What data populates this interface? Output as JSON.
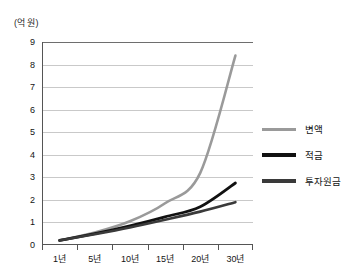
{
  "chart_data": {
    "type": "line",
    "title": "",
    "subtitle": "",
    "xlabel": "",
    "ylabel": "(억 원)",
    "grid": true,
    "legend_position": "right",
    "xlim": [
      0,
      30
    ],
    "ylim": [
      0,
      9
    ],
    "categories": [
      "1년",
      "5년",
      "10년",
      "15년",
      "20년",
      "30년"
    ],
    "x": [
      1,
      5,
      10,
      15,
      20,
      30
    ],
    "yticks": [
      0,
      1,
      2,
      3,
      4,
      5,
      6,
      7,
      8,
      9
    ],
    "ytick_labels": [
      "0",
      "1",
      "2",
      "3",
      "4",
      "5",
      "6",
      "7",
      "8",
      "9"
    ],
    "series": [
      {
        "name": "변액",
        "color": "#9a9a9a",
        "values": [
          0.2,
          0.55,
          1.05,
          1.85,
          3.2,
          8.4
        ]
      },
      {
        "name": "적금",
        "color": "#111111",
        "values": [
          0.2,
          0.5,
          0.85,
          1.25,
          1.7,
          2.75
        ]
      },
      {
        "name": "투자원금",
        "color": "#3a3a3a",
        "values": [
          0.2,
          0.48,
          0.78,
          1.12,
          1.48,
          1.9
        ]
      }
    ]
  },
  "axis": {
    "y_unit_caption": "(억 원)"
  },
  "legend": {
    "items": [
      {
        "label": "변액",
        "color": "#9a9a9a",
        "thickness": "3px"
      },
      {
        "label": "적금",
        "color": "#111111",
        "thickness": "4px"
      },
      {
        "label": "투자원금",
        "color": "#3a3a3a",
        "thickness": "4px"
      }
    ]
  }
}
